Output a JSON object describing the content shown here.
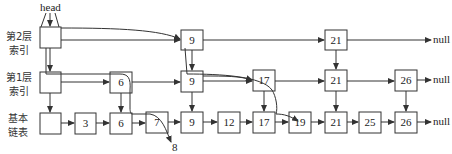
{
  "diagram": {
    "type": "skip-list",
    "head_label": "head",
    "null_label": "null",
    "levels": [
      {
        "id": "level2",
        "label_line1": "第2层",
        "label_line2": "索引",
        "nodes": [
          "",
          "9",
          "21"
        ]
      },
      {
        "id": "level1",
        "label_line1": "第1层",
        "label_line2": "索引",
        "nodes": [
          "",
          "6",
          "9",
          "17",
          "21",
          "26"
        ]
      },
      {
        "id": "level0",
        "label_line1": "基本",
        "label_line2": "链表",
        "nodes": [
          "",
          "3",
          "6",
          "7",
          "9",
          "12",
          "17",
          "19",
          "21",
          "25",
          "26"
        ]
      }
    ],
    "search_paths": [
      {
        "target": "8",
        "label": "8"
      },
      {
        "target": "19"
      }
    ],
    "insert_label": "8"
  }
}
